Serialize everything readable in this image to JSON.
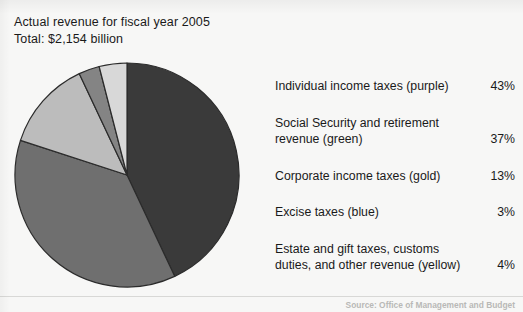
{
  "heading": {
    "line1": "Actual revenue for fiscal year 2005",
    "line2": "Total: $2,154 billion"
  },
  "source": {
    "text": "Source: Office of Management and Budget"
  },
  "legend": [
    {
      "label": "Individual income taxes (purple)",
      "pct": "43%"
    },
    {
      "label": "Social Security and retirement\nrevenue (green)",
      "pct": "37%"
    },
    {
      "label": "Corporate income taxes (gold)",
      "pct": "13%"
    },
    {
      "label": "Excise taxes (blue)",
      "pct": "3%"
    },
    {
      "label": "Estate and gift taxes, customs\nduties, and other revenue (yellow)",
      "pct": "4%"
    }
  ],
  "chart_data": {
    "type": "pie",
    "title": "Actual revenue for fiscal year 2005",
    "subtitle": "Total: $2,154 billion",
    "unit": "percent of total revenue",
    "total_label": "$2,154 billion",
    "start_angle_deg": 0,
    "direction": "clockwise",
    "legend_position": "right",
    "grid": false,
    "categories": [
      "Individual income taxes (purple)",
      "Social Security and retirement revenue (green)",
      "Corporate income taxes (gold)",
      "Excise taxes (blue)",
      "Estate and gift taxes, customs duties, and other revenue (yellow)"
    ],
    "values": [
      43,
      37,
      13,
      3,
      4
    ],
    "slice_colors": [
      "#3a3a3a",
      "#6f6f6f",
      "#bcbcbc",
      "#848484",
      "#d8d8d8"
    ],
    "slice_color_names": [
      "purple",
      "green",
      "gold",
      "blue",
      "yellow"
    ],
    "stroke_color": "#2b2b2b"
  }
}
